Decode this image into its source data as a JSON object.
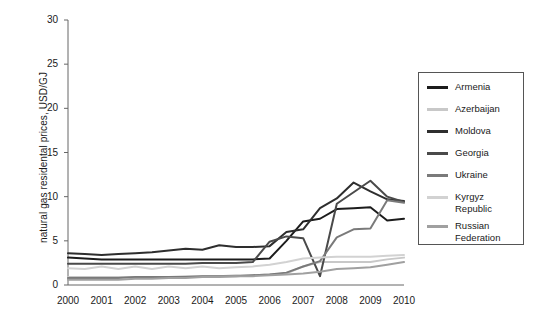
{
  "chart_data": {
    "type": "line",
    "title": "",
    "xlabel": "",
    "ylabel": "natural gas residental prices, USD/GJ",
    "xlim": [
      2000,
      2010
    ],
    "ylim": [
      0,
      30
    ],
    "grid": false,
    "legend_position": "right-outside",
    "x_ticks": [
      "2000",
      "2001",
      "2002",
      "2003",
      "2004",
      "2005",
      "2006",
      "2007",
      "2008",
      "2009",
      "2010"
    ],
    "y_ticks": [
      "0",
      "5",
      "10",
      "15",
      "20",
      "25",
      "30"
    ],
    "x": [
      2000,
      2000.5,
      2001,
      2001.5,
      2002,
      2002.5,
      2003,
      2003.5,
      2004,
      2004.5,
      2005,
      2005.5,
      2006,
      2006.5,
      2007,
      2007.5,
      2008,
      2008.5,
      2009,
      2009.5,
      2010
    ],
    "series": [
      {
        "name": "Armenia",
        "color": "#1c1c1c",
        "values": [
          3.1,
          3.0,
          2.9,
          2.9,
          2.9,
          2.9,
          2.9,
          2.9,
          2.9,
          2.9,
          2.9,
          2.9,
          3.0,
          5.0,
          7.2,
          7.5,
          8.6,
          8.7,
          8.8,
          7.3,
          7.5
        ]
      },
      {
        "name": "Azerbaijan",
        "color": "#c8c8c8",
        "values": [
          0.9,
          0.9,
          0.9,
          0.9,
          0.9,
          0.9,
          0.9,
          1.0,
          1.0,
          1.0,
          1.1,
          1.1,
          1.2,
          1.3,
          2.1,
          2.6,
          2.6,
          2.6,
          2.6,
          2.9,
          3.1
        ]
      },
      {
        "name": "Moldova",
        "color": "#2e2e2e",
        "values": [
          3.6,
          3.5,
          3.4,
          3.5,
          3.6,
          3.7,
          3.9,
          4.1,
          4.0,
          4.5,
          4.3,
          4.3,
          4.4,
          6.0,
          6.3,
          8.7,
          9.8,
          11.6,
          10.6,
          9.7,
          9.5
        ]
      },
      {
        "name": "Georgia",
        "color": "#4a4a4a",
        "values": [
          2.4,
          2.4,
          2.4,
          2.4,
          2.4,
          2.4,
          2.4,
          2.4,
          2.5,
          2.5,
          2.5,
          2.6,
          4.9,
          5.5,
          5.3,
          1.0,
          9.2,
          10.5,
          11.8,
          10.0,
          9.4
        ]
      },
      {
        "name": "Ukraine",
        "color": "#7a7a7a",
        "values": [
          0.8,
          0.8,
          0.8,
          0.8,
          0.9,
          0.9,
          0.9,
          0.9,
          1.0,
          1.0,
          1.0,
          1.1,
          1.2,
          1.4,
          2.1,
          2.7,
          5.4,
          6.3,
          6.4,
          9.6,
          9.3
        ]
      },
      {
        "name": "Kyrgyz\nRepublic",
        "color": "#d2d2d2",
        "values": [
          1.9,
          1.8,
          2.1,
          1.8,
          2.1,
          1.8,
          2.1,
          1.9,
          2.1,
          1.9,
          2.0,
          2.1,
          2.3,
          2.6,
          3.0,
          3.1,
          3.2,
          3.2,
          3.2,
          3.3,
          3.4
        ]
      },
      {
        "name": "Russian\nFederation",
        "color": "#a0a0a0",
        "values": [
          0.6,
          0.6,
          0.6,
          0.6,
          0.7,
          0.7,
          0.8,
          0.8,
          0.9,
          0.9,
          1.0,
          1.0,
          1.1,
          1.2,
          1.3,
          1.5,
          1.8,
          1.9,
          2.0,
          2.3,
          2.6
        ]
      }
    ]
  },
  "axis": {
    "label_y": "natural gas residental prices, USD/GJ"
  }
}
